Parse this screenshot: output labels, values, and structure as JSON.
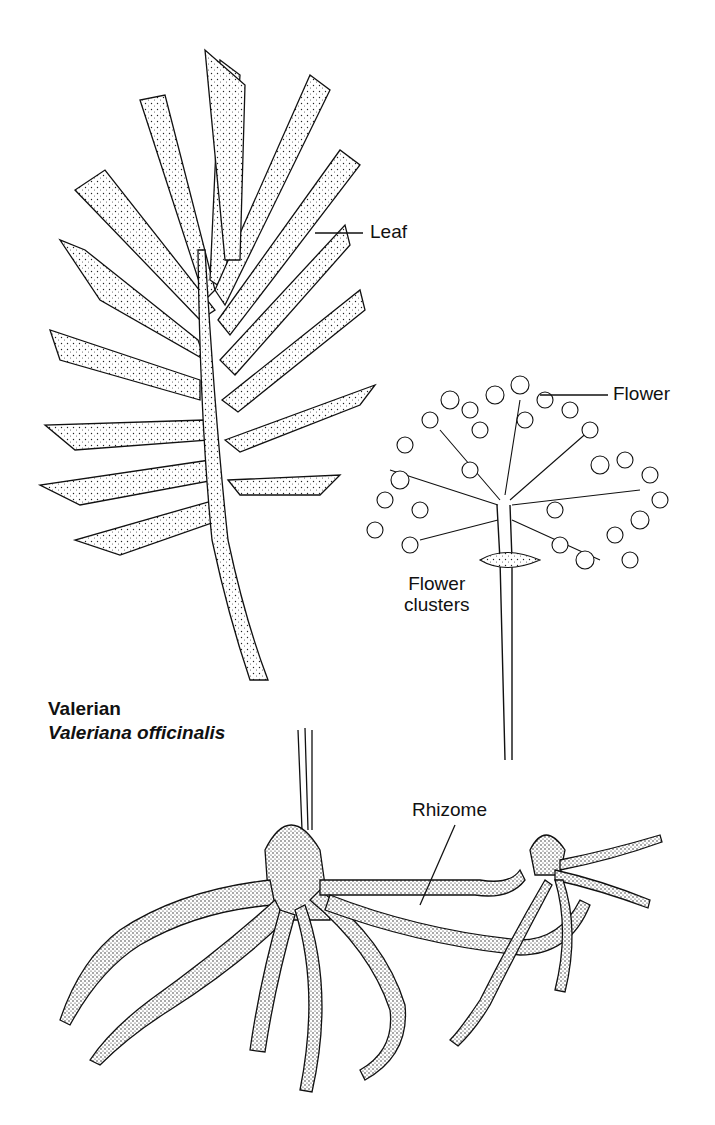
{
  "title": {
    "common_name": "Valerian",
    "scientific_name": "Valeriana officinalis"
  },
  "labels": {
    "leaf": "Leaf",
    "flower": "Flower",
    "flower_clusters_line1": "Flower",
    "flower_clusters_line2": "clusters",
    "rhizome": "Rhizome"
  },
  "colors": {
    "ink": "#111111",
    "background": "#ffffff"
  }
}
